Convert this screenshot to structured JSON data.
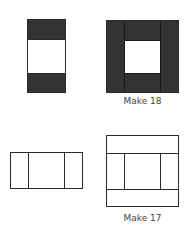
{
  "figures": [
    {
      "id": "top-left",
      "description": "Tall rectangle with dark top and bottom bands and white middle",
      "caption": ""
    },
    {
      "id": "top-right",
      "description": "Square frame with dark side columns, dark top and bottom center blocks, white center",
      "caption": "Make 18"
    },
    {
      "id": "bottom-left",
      "description": "Wide outlined rectangle divided into three columns",
      "caption": ""
    },
    {
      "id": "bottom-right",
      "description": "Outlined square with top and bottom bands and middle row split into three columns",
      "caption": "Make 17"
    }
  ],
  "colors": {
    "fill_dark": "#333333",
    "outline": "#2b2b2b",
    "caption_text": "#444444",
    "background": "#ffffff"
  }
}
